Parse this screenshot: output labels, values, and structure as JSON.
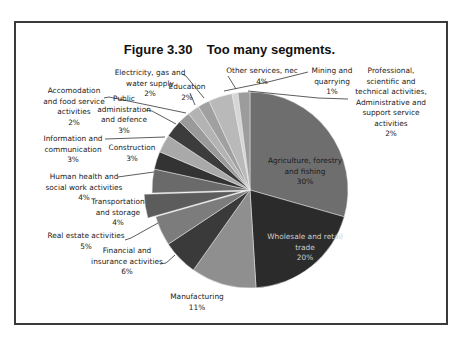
{
  "figure": {
    "title": "Figure 3.30    Too many segments."
  },
  "chart_data": {
    "type": "pie",
    "title": "Figure 3.30    Too many segments.",
    "xlabel": "",
    "ylabel": "",
    "legend": "none (data labels with leader lines)",
    "start_angle_deg": 0,
    "direction": "clockwise",
    "categories": [
      "Agriculture, forestry and fishing",
      "Wholesale and retail trade",
      "Manufacturing",
      "Financial and insurance activities",
      "Real estate activities",
      "Transportation and storage",
      "Human health and social work activities",
      "Construction",
      "Information and communication",
      "Public administration and defence",
      "Accomodation and food service activities",
      "Electricity, gas and water supply",
      "Education",
      "Other services, nec",
      "Mining and quarrying",
      "Professional, scientific and technical activities, Administrative and support service activities"
    ],
    "values": [
      30,
      20,
      11,
      6,
      5,
      4,
      4,
      3,
      3,
      3,
      2,
      2,
      2,
      4,
      1,
      2
    ],
    "value_labels": [
      "30%",
      "20%",
      "11%",
      "6%",
      "5%",
      "4%",
      "4%",
      "3%",
      "3%",
      "3%",
      "2%",
      "2%",
      "2%",
      "4%",
      "1%",
      "2%"
    ],
    "exploded": [
      "Transportation and storage"
    ],
    "colors": [
      "#6e6e6e",
      "#2b2b2b",
      "#8f8f8f",
      "#3a3a3a",
      "#7c7c7c",
      "#5c5c5c",
      "#6a6a6a",
      "#333333",
      "#a9a9a9",
      "#3c3c3c",
      "#9a9a9a",
      "#b3b3b3",
      "#a0a0a0",
      "#b9b9b9",
      "#d6d6d6",
      "#9c9c9c"
    ]
  },
  "labels": {
    "agriculture": "Agriculture, forestry\nand fishing\n30%",
    "wholesale": "Wholesale and retail\ntrade\n20%",
    "manufacturing": "Manufacturing\n11%",
    "financial": "Financial and\ninsurance activities\n6%",
    "real_estate": "Real estate activities\n5%",
    "transportation": "Transportation\nand  storage\n4%",
    "human_health": "Human health and\nsocial work activities\n4%",
    "construction": "Construction\n3%",
    "information": "Information and\ncommunication\n3%",
    "public_admin": "Public\nadministration\nand defence\n3%",
    "accomodation": "Accomodation\nand food service\nactivities\n2%",
    "electricity": "Electricity, gas and\nwater supply\n2%",
    "education": "Education\n2%",
    "other_services": "Other services, nec\n4%",
    "mining": "Mining and\nquarrying\n1%",
    "professional": "Professional,\nscientific and\ntechnical activities,\nAdministrative and\nsupport service\nactivities\n2%"
  }
}
